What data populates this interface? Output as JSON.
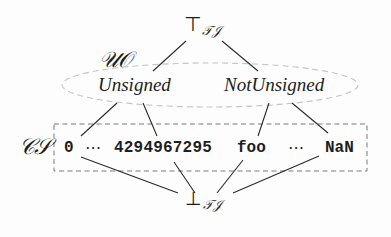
{
  "diagram": {
    "top": {
      "symbol": "⊤",
      "subscript": "𝒯𝒥"
    },
    "bottom": {
      "symbol": "⊥",
      "subscript": "𝒯𝒥"
    },
    "abstract_group": {
      "label": "𝒰𝒪",
      "nodes": [
        {
          "id": "unsigned",
          "label": "Unsigned"
        },
        {
          "id": "not-unsigned",
          "label": "NotUnsigned"
        }
      ]
    },
    "concrete_group": {
      "label": "𝒞𝒮",
      "values": [
        {
          "id": "zero",
          "label": "0"
        },
        {
          "id": "ellipsis-1",
          "label": "⋯"
        },
        {
          "id": "max-uint",
          "label": "4294967295"
        },
        {
          "id": "foo",
          "label": "foo"
        },
        {
          "id": "ellipsis-2",
          "label": "⋯"
        },
        {
          "id": "nan",
          "label": "NaN"
        }
      ]
    },
    "edges": [
      [
        "top",
        "unsigned"
      ],
      [
        "top",
        "not-unsigned"
      ],
      [
        "unsigned",
        "zero"
      ],
      [
        "unsigned",
        "max-uint"
      ],
      [
        "not-unsigned",
        "foo"
      ],
      [
        "not-unsigned",
        "nan"
      ],
      [
        "zero",
        "bottom"
      ],
      [
        "max-uint",
        "bottom"
      ],
      [
        "foo",
        "bottom"
      ],
      [
        "nan",
        "bottom"
      ]
    ],
    "colors": {
      "line": "#2a2a2a",
      "dashed_group": "#bdbdbd",
      "dashed_box": "#7a7a7a",
      "text": "#1e1e1e"
    }
  }
}
